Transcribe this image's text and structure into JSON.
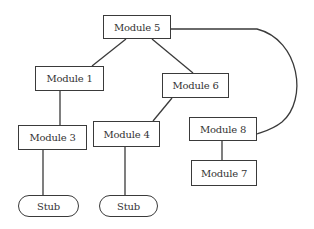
{
  "diagram": {
    "type": "module-hierarchy",
    "nodes": [
      {
        "id": "m5",
        "label": "Module 5",
        "shape": "rect",
        "x": 103,
        "y": 15,
        "w": 68,
        "h": 24
      },
      {
        "id": "m1",
        "label": "Module 1",
        "shape": "rect",
        "x": 35,
        "y": 66,
        "w": 69,
        "h": 25
      },
      {
        "id": "m6",
        "label": "Module 6",
        "shape": "rect",
        "x": 162,
        "y": 73,
        "w": 67,
        "h": 25
      },
      {
        "id": "m3",
        "label": "Module 3",
        "shape": "rect",
        "x": 18,
        "y": 125,
        "w": 69,
        "h": 25
      },
      {
        "id": "m4",
        "label": "Module 4",
        "shape": "rect",
        "x": 93,
        "y": 121,
        "w": 67,
        "h": 26
      },
      {
        "id": "m8",
        "label": "Module 8",
        "shape": "rect",
        "x": 189,
        "y": 117,
        "w": 68,
        "h": 24
      },
      {
        "id": "m7",
        "label": "Module 7",
        "shape": "rect",
        "x": 191,
        "y": 160,
        "w": 66,
        "h": 26
      },
      {
        "id": "stub1",
        "label": "Stub",
        "shape": "rounded",
        "x": 18,
        "y": 195,
        "w": 61,
        "h": 22
      },
      {
        "id": "stub2",
        "label": "Stub",
        "shape": "rounded",
        "x": 99,
        "y": 195,
        "w": 59,
        "h": 22
      }
    ],
    "edges": [
      {
        "from": "m5",
        "to": "m1"
      },
      {
        "from": "m5",
        "to": "m6"
      },
      {
        "from": "m5",
        "to": "m8",
        "style": "curved"
      },
      {
        "from": "m1",
        "to": "m3"
      },
      {
        "from": "m6",
        "to": "m4"
      },
      {
        "from": "m8",
        "to": "m7"
      },
      {
        "from": "m3",
        "to": "stub1"
      },
      {
        "from": "m4",
        "to": "stub2"
      }
    ]
  }
}
